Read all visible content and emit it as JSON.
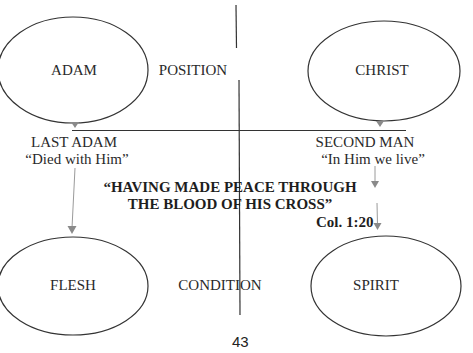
{
  "diagram": {
    "nodes": {
      "adam": "ADAM",
      "christ": "CHRIST",
      "flesh": "FLESH",
      "spirit": "SPIRIT"
    },
    "axis_labels": {
      "position": "POSITION",
      "condition": "CONDITION"
    },
    "left_branch": {
      "title": "LAST ADAM",
      "subtitle": "“Died with Him”"
    },
    "right_branch": {
      "title": "SECOND MAN",
      "subtitle": "“In Him we live”"
    },
    "quote": {
      "line1": "“HAVING MADE  PEACE THROUGH",
      "line2": "THE BLOOD OF HIS CROSS”",
      "reference": "Col. 1:20"
    },
    "page_number": "43",
    "colors": {
      "line": "#333333",
      "arrow": "#888888",
      "text": "#222222"
    }
  }
}
